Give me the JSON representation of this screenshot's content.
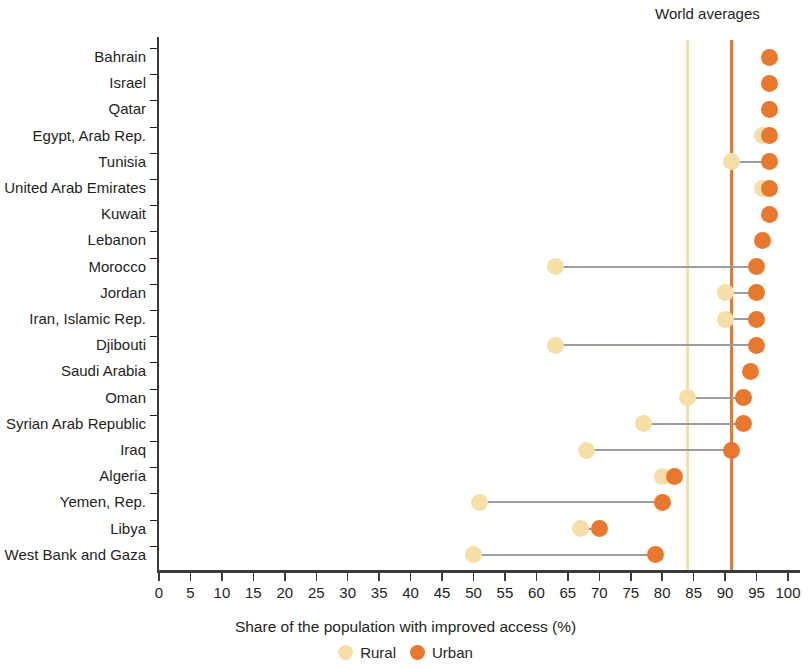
{
  "chart_data": {
    "type": "scatter",
    "subtype": "dumbbell",
    "title": "",
    "xlabel": "Share of the population with improved access (%)",
    "ylabel": "",
    "xlim": [
      0,
      100
    ],
    "xticks": [
      0,
      5,
      10,
      15,
      20,
      25,
      30,
      35,
      40,
      45,
      50,
      55,
      60,
      65,
      70,
      75,
      80,
      85,
      90,
      95,
      100
    ],
    "grid": false,
    "legend_position": "bottom",
    "legend": [
      {
        "name": "Rural",
        "color": "#f6dfa6"
      },
      {
        "name": "Urban",
        "color": "#e8782d"
      }
    ],
    "annotations": [
      {
        "text": "World averages",
        "type": "reference-line-group-label"
      }
    ],
    "reference_lines": [
      {
        "name": "Rural world average",
        "value": 84,
        "color": "#f6dfa6"
      },
      {
        "name": "Urban world average",
        "value": 91,
        "color": "#e8782d"
      }
    ],
    "categories": [
      "Bahrain",
      "Israel",
      "Qatar",
      "Egypt, Arab Rep.",
      "Tunisia",
      "United Arab Emirates",
      "Kuwait",
      "Lebanon",
      "Morocco",
      "Jordan",
      "Iran, Islamic Rep.",
      "Djibouti",
      "Saudi Arabia",
      "Oman",
      "Syrian Arab Republic",
      "Iraq",
      "Algeria",
      "Yemen, Rep.",
      "Libya",
      "West Bank and Gaza"
    ],
    "series": [
      {
        "name": "Rural",
        "color": "#f6dfa6",
        "values": [
          null,
          null,
          null,
          96,
          91,
          96,
          null,
          null,
          63,
          90,
          90,
          63,
          null,
          84,
          77,
          68,
          80,
          51,
          67,
          50
        ]
      },
      {
        "name": "Urban",
        "color": "#e8782d",
        "values": [
          97,
          97,
          97,
          97,
          97,
          97,
          97,
          96,
          95,
          95,
          95,
          95,
          94,
          93,
          93,
          91,
          82,
          80,
          70,
          79
        ]
      }
    ]
  },
  "annotation": {
    "world_averages_label": "World averages"
  },
  "axis": {
    "x_title": "Share of the population with improved access (%)",
    "tick_labels": [
      "0",
      "5",
      "10",
      "15",
      "20",
      "25",
      "30",
      "35",
      "40",
      "45",
      "50",
      "55",
      "60",
      "65",
      "70",
      "75",
      "80",
      "85",
      "90",
      "95",
      "100"
    ]
  },
  "legend": {
    "rural_label": "Rural",
    "urban_label": "Urban"
  },
  "colors": {
    "rural": "#f6dfa6",
    "urban": "#e8782d",
    "connector": "#9b9ba3",
    "axis": "#3b3b3b",
    "text": "#231f20"
  }
}
